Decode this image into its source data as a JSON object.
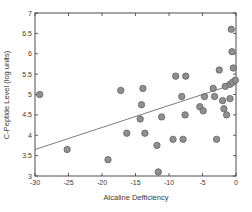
{
  "figure": {
    "width_px": 252,
    "height_px": 212
  },
  "chart_data": {
    "type": "scatter",
    "title": "",
    "xlabel": "Alcaline Defficiency",
    "ylabel": "C-Peptide Level (log units)",
    "xlim": [
      -30,
      0
    ],
    "ylim": [
      3,
      7
    ],
    "grid": false,
    "legend": null,
    "xtick_values": [
      -30,
      -25,
      -20,
      -15,
      -10,
      -5,
      0
    ],
    "xtick_labels": [
      "-30",
      "-25",
      "-20",
      "-15",
      "-10",
      "-5",
      "0"
    ],
    "ytick_values": [
      3,
      3.5,
      4,
      4.5,
      5,
      5.5,
      6,
      6.5,
      7
    ],
    "ytick_labels": [
      "3",
      "3.5",
      "4",
      "4.5",
      "5",
      "5.5",
      "6",
      "6.5",
      "7"
    ],
    "points": [
      [
        -29.3,
        5.0
      ],
      [
        -25.2,
        3.65
      ],
      [
        -19.1,
        3.4
      ],
      [
        -17.2,
        5.1
      ],
      [
        -16.3,
        4.05
      ],
      [
        -14.3,
        4.4
      ],
      [
        -14.1,
        4.75
      ],
      [
        -13.9,
        5.15
      ],
      [
        -13.6,
        4.05
      ],
      [
        -11.8,
        3.75
      ],
      [
        -11.6,
        3.1
      ],
      [
        -11.1,
        4.45
      ],
      [
        -9.4,
        3.9
      ],
      [
        -9.0,
        5.45
      ],
      [
        -8.1,
        4.95
      ],
      [
        -7.9,
        3.9
      ],
      [
        -7.6,
        4.5
      ],
      [
        -7.5,
        5.45
      ],
      [
        -5.4,
        4.7
      ],
      [
        -4.9,
        4.6
      ],
      [
        -4.7,
        4.95
      ],
      [
        -3.4,
        5.15
      ],
      [
        -3.2,
        4.95
      ],
      [
        -2.9,
        3.9
      ],
      [
        -2.5,
        5.6
      ],
      [
        -2.0,
        4.85
      ],
      [
        -1.8,
        4.65
      ],
      [
        -1.6,
        5.2
      ],
      [
        -1.4,
        4.5
      ],
      [
        -0.9,
        4.9
      ],
      [
        -0.9,
        5.25
      ],
      [
        -0.7,
        6.6
      ],
      [
        -0.6,
        6.05
      ],
      [
        -0.5,
        5.3
      ],
      [
        -0.4,
        5.65
      ],
      [
        -0.1,
        5.35
      ]
    ],
    "trend_line": {
      "x": [
        -30,
        0
      ],
      "y": [
        3.65,
        5.27
      ]
    },
    "marker": {
      "radius_px": 3.2
    },
    "colors": {
      "point_fill": "#8f8f8f",
      "point_stroke": "#636363",
      "trend_line": "#6e6e6e",
      "axis": "#3a3a3a",
      "text": "#3a3a3a",
      "background": "#ffffff"
    }
  }
}
